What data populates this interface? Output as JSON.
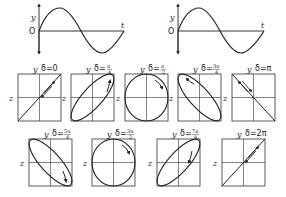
{
  "waves": [
    {
      "y_label": "y",
      "origin_label": "O",
      "t_label": "t",
      "phase": "0"
    },
    {
      "y_label": "y",
      "origin_label": "O",
      "t_label": "t",
      "phase": "0"
    }
  ],
  "panels": [
    {
      "y_label": "y",
      "z_label": "z",
      "delta_prefix": "δ=",
      "delta": "0",
      "num": "",
      "den": "",
      "shape": "line-pos"
    },
    {
      "y_label": "y",
      "z_label": "z",
      "delta_prefix": "δ=",
      "delta": "",
      "num": "π",
      "den": "4",
      "shape": "ellipse-pos"
    },
    {
      "y_label": "y",
      "z_label": "z",
      "delta_prefix": "δ=",
      "delta": "",
      "num": "π",
      "den": "2",
      "shape": "circle"
    },
    {
      "y_label": "y",
      "z_label": "z",
      "delta_prefix": "δ=",
      "delta": "",
      "num": "3π",
      "den": "4",
      "shape": "ellipse-neg"
    },
    {
      "y_label": "y",
      "z_label": "z",
      "delta_prefix": "δ=",
      "delta": "π",
      "num": "",
      "den": "",
      "shape": "line-neg"
    },
    {
      "y_label": "y",
      "z_label": "z",
      "delta_prefix": "δ=",
      "delta": "",
      "num": "5π",
      "den": "4",
      "shape": "ellipse-neg"
    },
    {
      "y_label": "y",
      "z_label": "z",
      "delta_prefix": "δ=",
      "delta": "",
      "num": "3π",
      "den": "2",
      "shape": "circle"
    },
    {
      "y_label": "y",
      "z_label": "z",
      "delta_prefix": "δ=",
      "delta": "",
      "num": "7π",
      "den": "4",
      "shape": "ellipse-pos"
    },
    {
      "y_label": "y",
      "z_label": "z",
      "delta_prefix": "δ=",
      "delta": "2π",
      "num": "",
      "den": "",
      "shape": "line-pos"
    }
  ]
}
